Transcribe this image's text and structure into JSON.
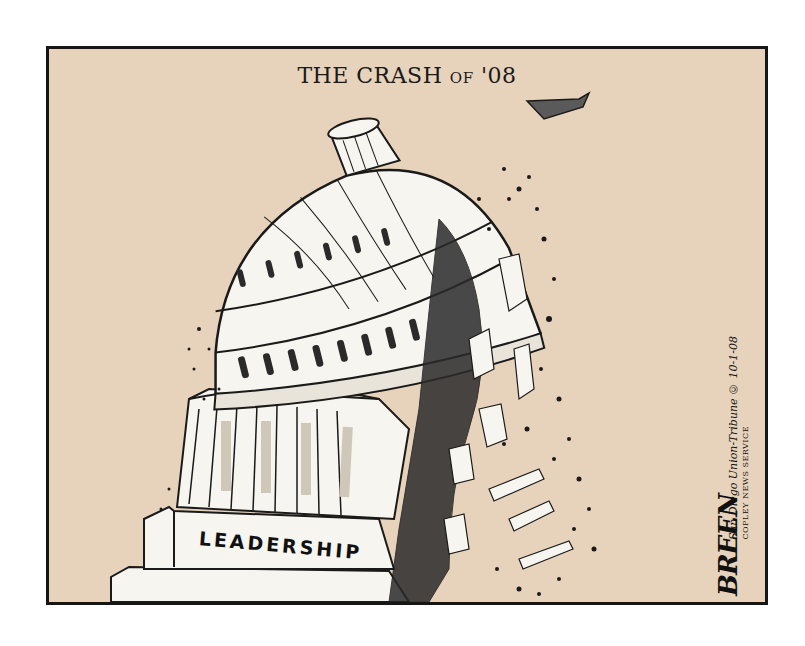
{
  "cartoon": {
    "title_main": "THE CRASH",
    "title_of": "OF",
    "title_year": "'08",
    "building_label": "LEADERSHIP",
    "artist_signature": "BREEN",
    "credit_line": "San Diego Union-Tribune © 10-1-08",
    "credit_service": "COPLEY NEWS SERVICE",
    "colors": {
      "background": "#e7d3bb",
      "border": "#161616",
      "ink": "#1a1a1a",
      "building": "#f7f5ef"
    }
  }
}
